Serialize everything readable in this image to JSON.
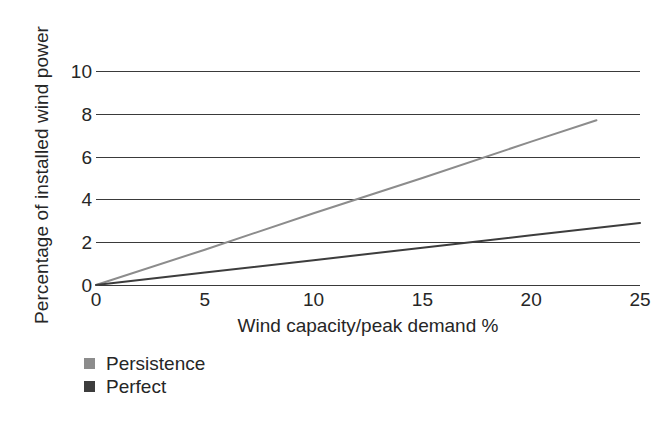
{
  "chart_data": {
    "type": "line",
    "title": "",
    "subtitle": "",
    "xlabel": "Wind capacity/peak demand %",
    "ylabel": "Percentage of installed wind power",
    "xlim": [
      0,
      25
    ],
    "ylim": [
      0,
      10
    ],
    "xticks": [
      0,
      5,
      10,
      15,
      20,
      25
    ],
    "yticks": [
      0,
      2,
      4,
      6,
      8,
      10
    ],
    "xtick_labels": [
      "0",
      "5",
      "10",
      "15",
      "20",
      "25"
    ],
    "ytick_labels": [
      "0",
      "2",
      "4",
      "6",
      "8",
      "10"
    ],
    "grid": "horizontal",
    "legend_position": "below-axes-left",
    "series": [
      {
        "name": "Persistence",
        "color": "#8c8c8c",
        "x": [
          0,
          5,
          10,
          15,
          20,
          23
        ],
        "values": [
          0.0,
          1.65,
          3.35,
          5.0,
          6.7,
          7.7
        ]
      },
      {
        "name": "Perfect",
        "color": "#3d3d3d",
        "x": [
          0,
          5,
          10,
          15,
          20,
          25
        ],
        "values": [
          0.0,
          0.58,
          1.16,
          1.74,
          2.32,
          2.9
        ]
      }
    ]
  },
  "legend": {
    "items": [
      {
        "label": "Persistence",
        "color": "#8c8c8c"
      },
      {
        "label": "Perfect",
        "color": "#3d3d3d"
      }
    ]
  },
  "colors": {
    "persistence": "#8c8c8c",
    "perfect": "#3d3d3d",
    "gridline": "#3a3a3a",
    "text": "#262626",
    "background": "#ffffff"
  }
}
